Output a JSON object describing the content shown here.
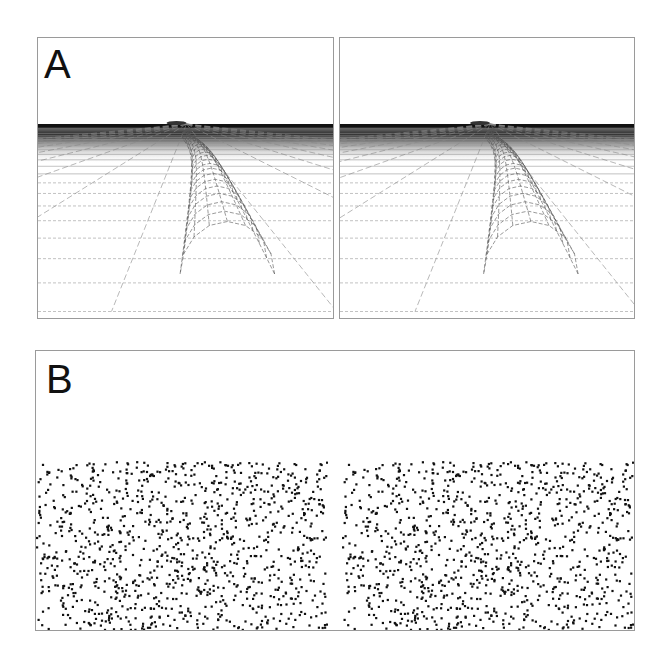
{
  "figure": {
    "panel_a": {
      "label": "A",
      "description": "Stereo pair of perspective wireframe ground plane with a curved tube receding to the horizon",
      "views": [
        "left-eye",
        "right-eye"
      ]
    },
    "panel_b": {
      "label": "B",
      "description": "Random-dot stereogram pair",
      "views": [
        "left-eye",
        "right-eye"
      ],
      "dot_color": "#111111"
    }
  }
}
